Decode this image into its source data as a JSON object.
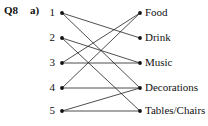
{
  "question": {
    "number": "Q8",
    "part": "a)"
  },
  "diagram": {
    "type": "bipartite-mapping",
    "left_nodes": [
      {
        "id": "1",
        "label": "1",
        "y": 13
      },
      {
        "id": "2",
        "label": "2",
        "y": 38
      },
      {
        "id": "3",
        "label": "3",
        "y": 63
      },
      {
        "id": "4",
        "label": "4",
        "y": 88
      },
      {
        "id": "5",
        "label": "5",
        "y": 111
      }
    ],
    "right_nodes": [
      {
        "id": "food",
        "label": "Food",
        "y": 13
      },
      {
        "id": "drink",
        "label": "Drink",
        "y": 38
      },
      {
        "id": "music",
        "label": "Music",
        "y": 63
      },
      {
        "id": "decorations",
        "label": "Decorations",
        "y": 88
      },
      {
        "id": "tables",
        "label": "Tables/Chairs",
        "y": 111
      }
    ],
    "edges": [
      {
        "from": "1",
        "to": "drink"
      },
      {
        "from": "1",
        "to": "decorations"
      },
      {
        "from": "2",
        "to": "music"
      },
      {
        "from": "2",
        "to": "tables"
      },
      {
        "from": "3",
        "to": "food"
      },
      {
        "from": "3",
        "to": "music"
      },
      {
        "from": "4",
        "to": "food"
      },
      {
        "from": "4",
        "to": "decorations"
      },
      {
        "from": "5",
        "to": "decorations"
      },
      {
        "from": "5",
        "to": "tables"
      }
    ],
    "geometry": {
      "left_x": 62,
      "right_x": 140,
      "dot_radius": 1.9
    },
    "colors": {
      "ink": "#111111",
      "edge": "#222222",
      "background": "#ffffff"
    }
  }
}
